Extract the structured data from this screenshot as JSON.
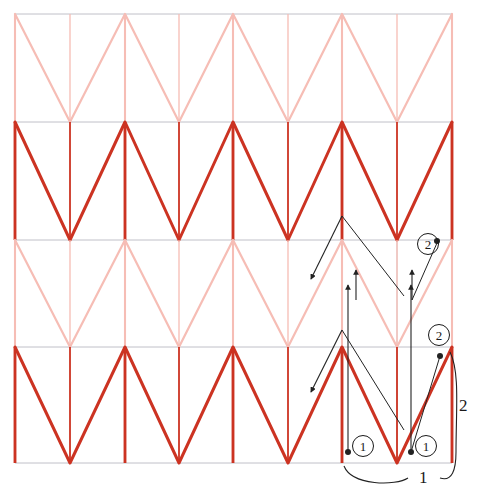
{
  "figure": {
    "type": "zigzag-pattern-diagram",
    "title": "",
    "canvas": {
      "width": 483,
      "height": 497
    },
    "colors": {
      "dark_red": "#cc3322",
      "light_pink": "#f6bdb5",
      "grid_line": "#b9b9c2",
      "annotation": "#222222",
      "background": "#ffffff"
    },
    "grid": {
      "left": 15,
      "right": 452,
      "rows_y": [
        14,
        122,
        240,
        347,
        463
      ],
      "columns_x": [
        15,
        70,
        125,
        179,
        233,
        288,
        342,
        397,
        452
      ],
      "row_count": 4,
      "column_count": 8
    },
    "rows": [
      {
        "index": 0,
        "shade": "light",
        "top": 14,
        "bottom": 122
      },
      {
        "index": 1,
        "shade": "dark",
        "top": 122,
        "bottom": 240
      },
      {
        "index": 2,
        "shade": "light",
        "top": 240,
        "bottom": 347
      },
      {
        "index": 3,
        "shade": "dark",
        "top": 347,
        "bottom": 463
      }
    ],
    "annotations": {
      "circled_numbers": [
        {
          "label": "②",
          "text": "2",
          "x": 427,
          "y": 243,
          "dot_x": 437,
          "dot_y": 241
        },
        {
          "label": "②",
          "text": "2",
          "x": 438,
          "y": 334,
          "dot_x": 440,
          "dot_y": 356
        },
        {
          "label": "①",
          "text": "1",
          "x": 362,
          "y": 445,
          "dot_x": 348,
          "dot_y": 452
        },
        {
          "label": "①",
          "text": "1",
          "x": 425,
          "y": 445,
          "dot_x": 411,
          "dot_y": 452
        }
      ],
      "brace_labels": [
        {
          "text": "1",
          "x": 424,
          "y": 478
        },
        {
          "text": "2",
          "x": 464,
          "y": 406
        }
      ],
      "arrow_count": 8
    }
  }
}
